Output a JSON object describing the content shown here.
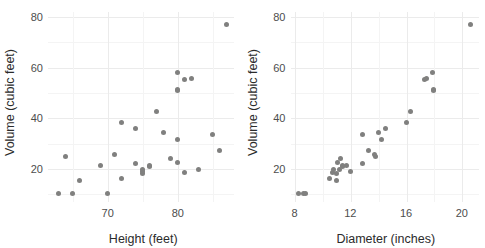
{
  "figure": {
    "title": "",
    "panel_count": 2
  },
  "panels": [
    {
      "name": "volume-vs-height",
      "xlabel": "Height (feet)",
      "ylabel": "Volume (cubic feet)",
      "xticks": [
        "70",
        "80"
      ],
      "yticks": [
        "20",
        "40",
        "60",
        "80"
      ]
    },
    {
      "name": "volume-vs-diameter",
      "xlabel": "Diameter (inches)",
      "ylabel": "Volume (cubic feet)",
      "xticks": [
        "8",
        "12",
        "16",
        "20"
      ],
      "yticks": [
        "20",
        "40",
        "60",
        "80"
      ]
    }
  ],
  "style": {
    "point_color": "#80807f",
    "grid_major_color": "#ebebeb",
    "grid_minor_color": "#f4f4f4",
    "background": "#ffffff",
    "tick_label_color": "#4d4d4d",
    "axis_title_color": "#2b2b2b"
  },
  "chart_data": [
    {
      "type": "scatter",
      "title": "",
      "xlabel": "Height (feet)",
      "ylabel": "Volume (cubic feet)",
      "xlim": [
        61.5,
        88.0
      ],
      "ylim": [
        7.0,
        82.0
      ],
      "xticks": [
        70,
        80
      ],
      "xticks_minor": [
        65,
        75,
        85
      ],
      "yticks": [
        20,
        40,
        60,
        80
      ],
      "yticks_minor": [
        10,
        30,
        50,
        70
      ],
      "grid": true,
      "legend": "none",
      "x": [
        70,
        65,
        63,
        72,
        81,
        83,
        66,
        75,
        80,
        75,
        79,
        76,
        76,
        69,
        75,
        74,
        85,
        86,
        71,
        64,
        78,
        80,
        74,
        72,
        77,
        81,
        82,
        80,
        80,
        80,
        87
      ],
      "y": [
        10.3,
        10.3,
        10.2,
        16.4,
        18.8,
        19.7,
        15.6,
        18.2,
        22.6,
        19.9,
        24.2,
        21.0,
        21.4,
        21.3,
        19.1,
        22.2,
        33.8,
        27.4,
        25.7,
        24.9,
        34.5,
        31.7,
        36.0,
        38.3,
        42.6,
        55.4,
        55.7,
        58.3,
        51.5,
        51.0,
        77.0
      ],
      "series_label": "trees"
    },
    {
      "type": "scatter",
      "title": "",
      "xlabel": "Diameter (inches)",
      "ylabel": "Volume (cubic feet)",
      "xlim": [
        7.7,
        21.2
      ],
      "ylim": [
        7.0,
        82.0
      ],
      "xticks": [
        8,
        12,
        16,
        20
      ],
      "xticks_minor": [
        10,
        14,
        18
      ],
      "yticks": [
        20,
        40,
        60,
        80
      ],
      "yticks_minor": [
        10,
        30,
        50,
        70
      ],
      "grid": true,
      "legend": "none",
      "x": [
        8.3,
        8.6,
        8.8,
        10.5,
        10.7,
        10.8,
        11.0,
        11.0,
        11.1,
        11.2,
        11.3,
        11.4,
        11.4,
        11.7,
        12.0,
        12.9,
        12.9,
        13.3,
        13.7,
        13.8,
        14.0,
        14.2,
        14.5,
        16.0,
        16.3,
        17.3,
        17.5,
        17.9,
        18.0,
        18.0,
        20.6
      ],
      "y": [
        10.3,
        10.3,
        10.2,
        16.4,
        18.8,
        19.7,
        15.6,
        18.2,
        22.6,
        19.9,
        24.2,
        21.0,
        21.4,
        21.3,
        19.1,
        22.2,
        33.8,
        27.4,
        25.7,
        24.9,
        34.5,
        31.7,
        36.0,
        38.3,
        42.6,
        55.4,
        55.7,
        58.3,
        51.5,
        51.0,
        77.0
      ],
      "series_label": "trees"
    }
  ]
}
